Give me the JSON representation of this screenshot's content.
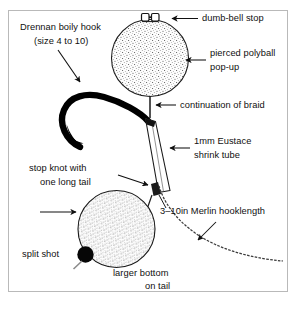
{
  "diagram": {
    "frame_color": "#b9b9b9",
    "background_color": "#ffffff",
    "ink_color": "#101010"
  },
  "labels": {
    "hook_line1": "Drennan boily hook",
    "hook_line2": "(size 4 to 10)",
    "dumbbell_stop": "dumb-bell stop",
    "polyball_line1": "pierced polyball",
    "polyball_line2": "pop-up",
    "braid": "continuation of braid",
    "shrink_line1": "1mm Eustace",
    "shrink_line2": "shrink tube",
    "stopknot_line1": "stop knot with",
    "stopknot_line2": "one long tail",
    "hooklength": "3–10in Merlin hooklength",
    "split_shot": "split shot",
    "bottom_line1": "larger bottom",
    "bottom_line2": "on tail"
  },
  "parts": {
    "top_polyball": "pierced polyball pop-up",
    "bottom_polyball": "larger bottom polyball on tail",
    "hook": "boily hook",
    "shrink_tube": "1mm shrink tube",
    "stop_knot": "stop knot",
    "split_shot_weight": "split shot",
    "hooklength_line": "Merlin hooklength",
    "dumbbell": "dumb-bell stop"
  }
}
